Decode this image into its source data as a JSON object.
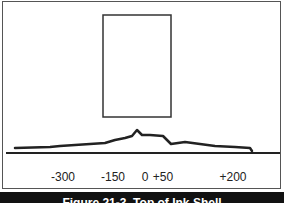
{
  "figure": {
    "caption": "Figure 21-3. Top of Ink Shell",
    "colors": {
      "background": "#ffffff",
      "frame": "#555555",
      "line": "#222222",
      "caption_bar": "#111111",
      "caption_text": "#ffffff"
    },
    "rectangle": {
      "x": 103,
      "y": 15,
      "width": 68,
      "height": 102
    },
    "baseline": {
      "y": 153,
      "x1": 6,
      "x2": 280
    },
    "profile_curve": {
      "points": [
        [
          15,
          148
        ],
        [
          50,
          147
        ],
        [
          60,
          146
        ],
        [
          75,
          145
        ],
        [
          90,
          144
        ],
        [
          105,
          143
        ],
        [
          115,
          140
        ],
        [
          125,
          138
        ],
        [
          132,
          136
        ],
        [
          137,
          130
        ],
        [
          142,
          135
        ],
        [
          150,
          135
        ],
        [
          163,
          136
        ],
        [
          171,
          144
        ],
        [
          185,
          142
        ],
        [
          200,
          144
        ],
        [
          215,
          146
        ],
        [
          235,
          147
        ],
        [
          250,
          148
        ],
        [
          252,
          151
        ]
      ]
    },
    "axis_labels": [
      {
        "text": "-300",
        "x": 63
      },
      {
        "text": "-150",
        "x": 113
      },
      {
        "text": "0",
        "x": 145
      },
      {
        "text": "+50",
        "x": 163
      },
      {
        "text": "+200",
        "x": 233
      }
    ]
  }
}
